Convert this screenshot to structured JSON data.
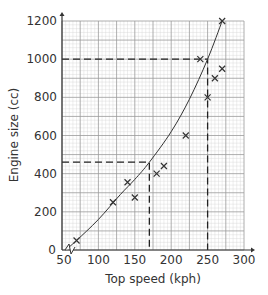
{
  "chart_data": {
    "type": "scatter",
    "title": "",
    "xlabel": "Top speed (kph)",
    "ylabel": "Engine size (cc)",
    "xlim": [
      50,
      300
    ],
    "ylim": [
      0,
      1200
    ],
    "x_ticks": [
      50,
      100,
      150,
      200,
      250,
      300
    ],
    "y_ticks": [
      0,
      200,
      400,
      600,
      800,
      1000,
      1200
    ],
    "grid": true,
    "legend": null,
    "series": [
      {
        "name": "data points",
        "marker": "x",
        "points": [
          {
            "x": 70,
            "y": 50
          },
          {
            "x": 120,
            "y": 250
          },
          {
            "x": 140,
            "y": 355
          },
          {
            "x": 150,
            "y": 275
          },
          {
            "x": 180,
            "y": 400
          },
          {
            "x": 190,
            "y": 440
          },
          {
            "x": 220,
            "y": 600
          },
          {
            "x": 240,
            "y": 1000
          },
          {
            "x": 250,
            "y": 800
          },
          {
            "x": 260,
            "y": 900
          },
          {
            "x": 270,
            "y": 950
          },
          {
            "x": 270,
            "y": 1200
          }
        ]
      },
      {
        "name": "curve of best fit",
        "type": "line",
        "points": [
          {
            "x": 55,
            "y": 0
          },
          {
            "x": 70,
            "y": 50
          },
          {
            "x": 100,
            "y": 160
          },
          {
            "x": 130,
            "y": 290
          },
          {
            "x": 150,
            "y": 370
          },
          {
            "x": 170,
            "y": 460
          },
          {
            "x": 200,
            "y": 620
          },
          {
            "x": 225,
            "y": 790
          },
          {
            "x": 250,
            "y": 1000
          },
          {
            "x": 270,
            "y": 1200
          }
        ]
      }
    ],
    "annotations": [
      {
        "type": "dashed-guide",
        "from": {
          "x": 50,
          "y": 460
        },
        "corner": {
          "x": 170,
          "y": 460
        },
        "to": {
          "x": 170,
          "y": 0
        }
      },
      {
        "type": "dashed-guide",
        "from": {
          "x": 50,
          "y": 1000
        },
        "corner": {
          "x": 250,
          "y": 1000
        },
        "to": {
          "x": 250,
          "y": 0
        }
      },
      {
        "type": "axis-break",
        "at": {
          "x": 60,
          "y": 0
        }
      }
    ]
  },
  "colors": {
    "axis": "#333333",
    "grid_minor": "#d4d4d4",
    "grid_major": "#9a9a9a",
    "curve": "#333333",
    "marker": "#333333",
    "dashed": "#222222"
  }
}
